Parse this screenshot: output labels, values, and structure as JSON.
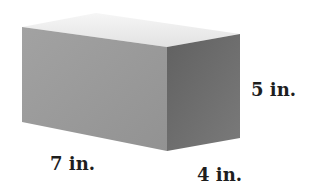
{
  "figure": {
    "type": "rectangular-prism",
    "dimensions": {
      "length": "7 in.",
      "width": "4 in.",
      "height": "5 in."
    },
    "colors": {
      "top_face": "#ececec",
      "front_face": "#9a9a9a",
      "side_face": "#6e6e6e",
      "label_text": "#1e1e1e"
    }
  }
}
